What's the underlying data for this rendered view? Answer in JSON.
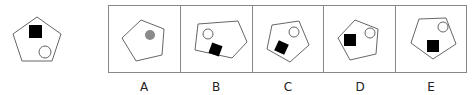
{
  "puzzle": {
    "question_figure": {
      "shape": "pentagon",
      "elements": [
        {
          "type": "square",
          "fill": "#000000"
        },
        {
          "type": "circle",
          "fill": "#ffffff"
        }
      ]
    },
    "options": [
      {
        "label": "A",
        "elements": [
          {
            "type": "circle",
            "fill": "#8a8a8a"
          }
        ]
      },
      {
        "label": "B",
        "elements": [
          {
            "type": "circle",
            "fill": "#ffffff"
          },
          {
            "type": "square",
            "fill": "#000000"
          }
        ]
      },
      {
        "label": "C",
        "elements": [
          {
            "type": "circle",
            "fill": "#ffffff"
          },
          {
            "type": "square",
            "fill": "#000000"
          }
        ]
      },
      {
        "label": "D",
        "elements": [
          {
            "type": "square",
            "fill": "#000000"
          },
          {
            "type": "circle",
            "fill": "#ffffff"
          }
        ]
      },
      {
        "label": "E",
        "elements": [
          {
            "type": "circle",
            "fill": "#ffffff"
          },
          {
            "type": "square",
            "fill": "#000000"
          }
        ]
      }
    ]
  },
  "colors": {
    "stroke": "#666666",
    "frame": "#888888",
    "square": "#000000",
    "gray_circle": "#8a8a8a"
  }
}
